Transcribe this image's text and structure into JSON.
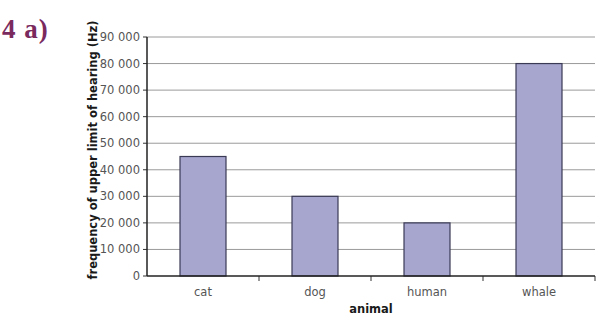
{
  "question_label": "4 a)",
  "chart_data": {
    "type": "bar",
    "title": "",
    "xlabel": "animal",
    "ylabel": "frequency of upper limit of hearing (Hz)",
    "categories": [
      "cat",
      "dog",
      "human",
      "whale"
    ],
    "values": [
      45000,
      30000,
      20000,
      80000
    ],
    "ylim": [
      0,
      90000
    ],
    "yticks": [
      0,
      10000,
      20000,
      30000,
      40000,
      50000,
      60000,
      70000,
      80000,
      90000
    ],
    "ytick_labels": [
      "0",
      "10 000",
      "20 000",
      "30 000",
      "40 000",
      "50 000",
      "60 000",
      "70 000",
      "80 000",
      "90 000"
    ],
    "grid": true,
    "legend": "none",
    "bar_color": "#a6a6cf",
    "bar_edge_color": "#3a3a55"
  }
}
